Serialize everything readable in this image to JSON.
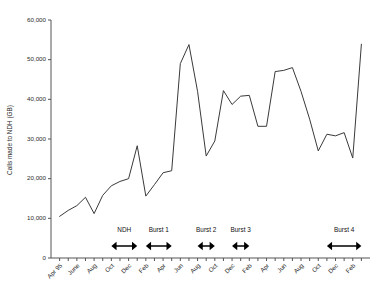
{
  "chart_data": {
    "type": "line",
    "title": "",
    "subtitle": "",
    "xlabel": "",
    "ylabel": "Calls made to NDH (GB)",
    "ylim": [
      0,
      60000
    ],
    "yticks": [
      0,
      10000,
      20000,
      30000,
      40000,
      50000,
      60000
    ],
    "ytick_labels": [
      "0",
      "10,000",
      "20,000",
      "30,000",
      "40,000",
      "50,000",
      "60,000"
    ],
    "grid": false,
    "legend": false,
    "legend_position": "none",
    "line_color": "#3a3a3a",
    "axis_color": "#555555",
    "background_color": "#ffffff",
    "x_tick_interval_months": 1,
    "x_label_interval_months": 2,
    "x_labels_rotated": true,
    "x_labels_rotation_deg": -45,
    "xtick_labels": [
      "Apr 95",
      "",
      "June",
      "",
      "Aug",
      "",
      "Oct",
      "",
      "Dec",
      "",
      "Feb",
      "",
      "Apr",
      "",
      "Jun",
      "",
      "Aug",
      "",
      "Oct",
      "",
      "Dec",
      "",
      "Feb",
      "",
      "Apr",
      "",
      "Jun",
      "",
      "Aug",
      "",
      "Oct",
      "",
      "Dec",
      "",
      "Feb",
      ""
    ],
    "x": [
      "Apr 95",
      "May 95",
      "Jun 95",
      "Jul 95",
      "Aug 95",
      "Sep 95",
      "Oct 95",
      "Nov 95",
      "Dec 95",
      "Jan 96",
      "Feb 96",
      "Mar 96",
      "Apr 96",
      "May 96",
      "Jun 96",
      "Jul 96",
      "Aug 96",
      "Sep 96",
      "Oct 96",
      "Nov 96",
      "Dec 96",
      "Jan 97",
      "Feb 97",
      "Mar 97",
      "Apr 97",
      "May 97",
      "Jun 97",
      "Jul 97",
      "Aug 97",
      "Sep 97",
      "Oct 97",
      "Nov 97",
      "Dec 97",
      "Jan 98",
      "Feb 98",
      "Mar 98"
    ],
    "values": [
      10500,
      12000,
      13200,
      15300,
      11200,
      15800,
      18200,
      19300,
      20000,
      28300,
      15600,
      18500,
      21500,
      22000,
      49000,
      53800,
      42000,
      25700,
      29500,
      42200,
      38700,
      40800,
      41000,
      33200,
      33200,
      47000,
      47300,
      48000,
      42000,
      35000,
      27000,
      31200,
      30800,
      31600,
      25200,
      53900
    ],
    "annotations": [
      {
        "label": "NDH",
        "start": "Oct 95",
        "end": "Jan 96"
      },
      {
        "label": "Burst 1",
        "start": "Feb 96",
        "end": "May 96"
      },
      {
        "label": "Burst 2",
        "start": "Aug 96",
        "end": "Oct 96"
      },
      {
        "label": "Burst 3",
        "start": "Dec 96",
        "end": "Feb 97"
      },
      {
        "label": "Burst 4",
        "start": "Nov 97",
        "end": "Mar 98"
      }
    ]
  }
}
